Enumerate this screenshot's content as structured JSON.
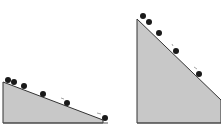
{
  "diagram": {
    "colors": {
      "ramp_fill": "#c8c8c8",
      "ramp_edge": "#333333",
      "ball": "#1a1a1a",
      "background": "#ffffff"
    },
    "ramps": [
      {
        "name": "shallow-ramp",
        "points": "3,82 103,120 103,123 3,123",
        "balls": [
          [
            8,
            80
          ],
          [
            14,
            82
          ],
          [
            24,
            86
          ],
          [
            43,
            94
          ],
          [
            67,
            103
          ],
          [
            105,
            118
          ]
        ],
        "marks": [
          [
            62,
            99
          ],
          [
            99,
            114
          ]
        ]
      },
      {
        "name": "steep-ramp",
        "points": "137,19 221,100 221,123 137,123",
        "balls": [
          [
            143,
            16
          ],
          [
            149,
            22
          ],
          [
            159,
            33
          ],
          [
            176,
            51
          ],
          [
            199,
            74
          ]
        ],
        "marks": [
          [
            172,
            45
          ],
          [
            195,
            68
          ]
        ]
      }
    ]
  }
}
